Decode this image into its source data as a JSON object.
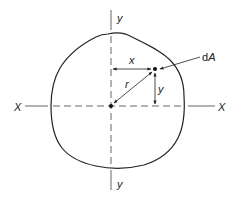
{
  "figure": {
    "labels": {
      "x_axis_left": "X",
      "x_axis_right": "X",
      "y_axis_top": "y",
      "y_axis_bottom": "y",
      "x_distance": "x",
      "y_distance": "y",
      "radius": "r",
      "element_d": "d",
      "element_A": "A"
    },
    "colors": {
      "stroke": "#222222",
      "axis": "#555555",
      "background": "#ffffff"
    }
  }
}
